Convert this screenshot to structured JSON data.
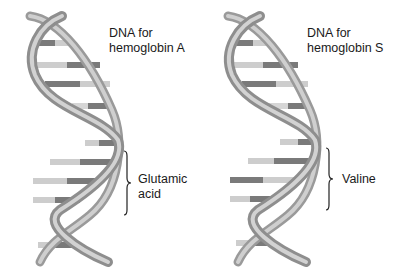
{
  "panels": [
    {
      "id": "hemoglobin-a",
      "title_line1": "DNA for",
      "title_line2": "hemoglobin A",
      "bracket_label_line1": "Glutamic",
      "bracket_label_line2": "acid"
    },
    {
      "id": "hemoglobin-s",
      "title_line1": "DNA for",
      "title_line2": "hemoglobin S",
      "bracket_label_line1": "Valine",
      "bracket_label_line2": ""
    }
  ],
  "colors": {
    "backbone": "#b8b8b8",
    "backbone_shadow": "#8c8c8c",
    "base_light": "#c9c9c9",
    "base_dark": "#7a7a7a",
    "text": "#1a1a1a",
    "background": "#ffffff"
  }
}
